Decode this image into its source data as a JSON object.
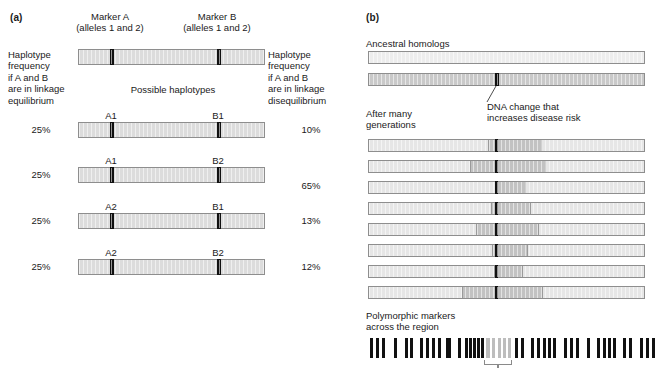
{
  "figure": {
    "panel_a": {
      "label": "(a)",
      "marker_a_title": "Marker A",
      "marker_a_sub": "(alleles 1 and 2)",
      "marker_b_title": "Marker B",
      "marker_b_sub": "(alleles 1 and 2)",
      "left_caption": "Haplotype\nfrequency\nif A and B\nare in linkage\nequilibrium",
      "right_caption": "Haplotype\nfrequency\nif A and B\nare in linkage\ndisequilibrium",
      "middle_caption": "Possible haplotypes",
      "haplotypes": [
        {
          "allele_a": "A1",
          "allele_b": "B1",
          "freq_equilibrium": "25%",
          "freq_disequilibrium": "10%"
        },
        {
          "allele_a": "A1",
          "allele_b": "B2",
          "freq_equilibrium": "25%",
          "freq_disequilibrium": "65%"
        },
        {
          "allele_a": "A2",
          "allele_b": "B1",
          "freq_equilibrium": "25%",
          "freq_disequilibrium": "13%"
        },
        {
          "allele_a": "A2",
          "allele_b": "B2",
          "freq_equilibrium": "25%",
          "freq_disequilibrium": "12%"
        }
      ]
    },
    "panel_b": {
      "label": "(b)",
      "ancestral_caption": "Ancestral homologs",
      "mutation_caption": "DNA change that\nincreases disease risk",
      "generations_caption": "After many\ngenerations",
      "markers_caption": "Polymorphic markers\nacross the region",
      "ancestral_bars": [
        {
          "shade": "pale",
          "has_mutation": false
        },
        {
          "shade": "mid",
          "has_mutation": true
        }
      ],
      "generation_bars": [
        {
          "seg_left_pct": 43.0,
          "seg_right_pct": 62.5
        },
        {
          "seg_left_pct": 36.5,
          "seg_right_pct": 64.0
        },
        {
          "seg_left_pct": 45.5,
          "seg_right_pct": 56.5
        },
        {
          "seg_left_pct": 44.0,
          "seg_right_pct": 58.5
        },
        {
          "seg_left_pct": 38.5,
          "seg_right_pct": 61.5
        },
        {
          "seg_left_pct": 44.5,
          "seg_right_pct": 57.5
        },
        {
          "seg_left_pct": 45.0,
          "seg_right_pct": 55.5
        },
        {
          "seg_left_pct": 33.5,
          "seg_right_pct": 63.0
        }
      ],
      "marker_ticks": [
        {
          "x": 2,
          "w": 3,
          "gray": false
        },
        {
          "x": 8,
          "w": 3,
          "gray": false
        },
        {
          "x": 14,
          "w": 3,
          "gray": false
        },
        {
          "x": 26,
          "w": 3,
          "gray": false
        },
        {
          "x": 37,
          "w": 3,
          "gray": false
        },
        {
          "x": 42,
          "w": 3,
          "gray": false
        },
        {
          "x": 52,
          "w": 3,
          "gray": false
        },
        {
          "x": 58,
          "w": 3,
          "gray": false
        },
        {
          "x": 64,
          "w": 3,
          "gray": false
        },
        {
          "x": 70,
          "w": 3,
          "gray": false
        },
        {
          "x": 78,
          "w": 5,
          "gray": false
        },
        {
          "x": 90,
          "w": 3,
          "gray": false
        },
        {
          "x": 97,
          "w": 2.5,
          "gray": false
        },
        {
          "x": 101,
          "w": 2.5,
          "gray": false
        },
        {
          "x": 105,
          "w": 2.5,
          "gray": false
        },
        {
          "x": 109,
          "w": 2.5,
          "gray": false
        },
        {
          "x": 113,
          "w": 2.5,
          "gray": false
        },
        {
          "x": 118,
          "w": 4,
          "gray": true
        },
        {
          "x": 124,
          "w": 3,
          "gray": true
        },
        {
          "x": 130,
          "w": 2.5,
          "gray": true
        },
        {
          "x": 135,
          "w": 2.5,
          "gray": true
        },
        {
          "x": 140,
          "w": 3,
          "gray": true
        },
        {
          "x": 147,
          "w": 3,
          "gray": false
        },
        {
          "x": 153,
          "w": 3,
          "gray": false
        },
        {
          "x": 163,
          "w": 3,
          "gray": false
        },
        {
          "x": 169,
          "w": 3,
          "gray": false
        },
        {
          "x": 175,
          "w": 2.5,
          "gray": false
        },
        {
          "x": 180,
          "w": 2.5,
          "gray": false
        },
        {
          "x": 185,
          "w": 3,
          "gray": false
        },
        {
          "x": 196,
          "w": 3,
          "gray": false
        },
        {
          "x": 202,
          "w": 3,
          "gray": false
        },
        {
          "x": 208,
          "w": 3,
          "gray": false
        },
        {
          "x": 219,
          "w": 3,
          "gray": false
        },
        {
          "x": 229,
          "w": 3,
          "gray": false
        },
        {
          "x": 235,
          "w": 3,
          "gray": false
        },
        {
          "x": 240,
          "w": 3,
          "gray": false
        },
        {
          "x": 245,
          "w": 3,
          "gray": false
        },
        {
          "x": 255,
          "w": 3,
          "gray": false
        },
        {
          "x": 261,
          "w": 3,
          "gray": false
        },
        {
          "x": 272,
          "w": 3,
          "gray": false
        },
        {
          "x": 278,
          "w": 3,
          "gray": false
        },
        {
          "x": 284,
          "w": 3,
          "gray": false
        }
      ]
    }
  },
  "colors": {
    "bar_fill": "#dcdcdc",
    "bar_fill_light": "#e6e6e6",
    "bar_fill_mid": "#c9c9c9",
    "bar_fill_pale": "#ededed",
    "bar_border": "#8e8e8e",
    "tick_black": "#111111",
    "tick_gray": "#bdbdbd",
    "segment": "#c2c2c2",
    "text": "#1a1a1a"
  }
}
